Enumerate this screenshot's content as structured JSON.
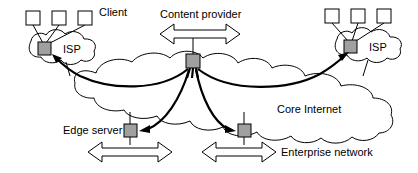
{
  "diagram": {
    "type": "network-topology",
    "canvas": {
      "width": 418,
      "height": 173
    },
    "colors": {
      "background": "#ffffff",
      "stroke": "#000000",
      "node_fill": "#a0a0a0",
      "host_fill": "#ffffff"
    },
    "labels": {
      "client": "Client",
      "content_provider": "Content provider",
      "core_internet": "Core Internet",
      "edge_server": "Edge server",
      "enterprise_network": "Enterprise network",
      "isp_left": "ISP",
      "isp_right": "ISP"
    },
    "clouds": [
      {
        "id": "core-internet",
        "label": "Core Internet",
        "label_x": 277,
        "label_y": 113
      },
      {
        "id": "isp-left",
        "label": "ISP",
        "label_x": 72,
        "label_y": 52
      },
      {
        "id": "isp-right",
        "label": "ISP",
        "label_x": 375,
        "label_y": 50
      }
    ],
    "nodes": [
      {
        "id": "isp-left-router",
        "kind": "router",
        "x": 38,
        "y": 42,
        "w": 13,
        "h": 13
      },
      {
        "id": "isp-right-router",
        "kind": "router",
        "x": 344,
        "y": 40,
        "w": 13,
        "h": 13
      },
      {
        "id": "content-provider-server",
        "kind": "server",
        "x": 186,
        "y": 54,
        "w": 14,
        "h": 14
      },
      {
        "id": "edge-server-node",
        "kind": "server",
        "x": 124,
        "y": 124,
        "w": 13,
        "h": 13
      },
      {
        "id": "enterprise-node",
        "kind": "server",
        "x": 238,
        "y": 124,
        "w": 13,
        "h": 13
      }
    ],
    "hosts_left": [
      {
        "id": "client-host-1",
        "x": 26,
        "y": 11,
        "w": 14,
        "h": 14
      },
      {
        "id": "client-host-2",
        "x": 52,
        "y": 11,
        "w": 14,
        "h": 14
      },
      {
        "id": "client-host-3",
        "x": 78,
        "y": 11,
        "w": 14,
        "h": 14
      }
    ],
    "hosts_right": [
      {
        "id": "remote-host-1",
        "x": 325,
        "y": 9,
        "w": 14,
        "h": 14
      },
      {
        "id": "remote-host-2",
        "x": 351,
        "y": 9,
        "w": 14,
        "h": 14
      },
      {
        "id": "remote-host-3",
        "x": 377,
        "y": 9,
        "w": 14,
        "h": 14
      }
    ],
    "block_arrows": [
      {
        "id": "content-provider-arrow",
        "orientation": "horizontal",
        "label": "Content provider"
      },
      {
        "id": "edge-server-arrow",
        "orientation": "horizontal",
        "label": "Edge server"
      },
      {
        "id": "enterprise-arrow",
        "orientation": "horizontal",
        "label": "Enterprise network"
      }
    ],
    "flows": [
      {
        "id": "flow-to-isp-left",
        "from": "content-provider-server",
        "to": "isp-left-router",
        "direction": "to-target"
      },
      {
        "id": "flow-to-isp-right",
        "from": "content-provider-server",
        "to": "isp-right-router",
        "direction": "to-target"
      },
      {
        "id": "flow-to-edge-server",
        "from": "content-provider-server",
        "to": "edge-server-node",
        "direction": "to-target"
      },
      {
        "id": "flow-to-enterprise",
        "from": "content-provider-server",
        "to": "enterprise-node",
        "direction": "to-target"
      }
    ]
  }
}
